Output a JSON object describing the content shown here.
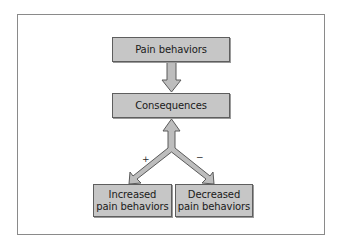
{
  "diagram": {
    "nodes": {
      "pain_behaviors": "Pain behaviors",
      "consequences": "Consequences",
      "increased": {
        "line1": "Increased",
        "line2": "pain behaviors"
      },
      "decreased": {
        "line1": "Decreased",
        "line2": "pain behaviors"
      }
    },
    "edges": [
      {
        "from": "Pain behaviors",
        "to": "Consequences",
        "label": ""
      },
      {
        "from": "Consequences",
        "to": "Increased pain behaviors",
        "label": "+"
      },
      {
        "from": "Consequences",
        "to": "Decreased pain behaviors",
        "label": "−"
      }
    ],
    "labels": {
      "plus": "+",
      "minus": "−"
    },
    "colors": {
      "node_fill": "#c6c6c6",
      "node_border": "#5e5e5e",
      "arrow_fill": "#bdbdbd",
      "arrow_stroke": "#5a5a5a",
      "frame_border": "#8a8a8a"
    }
  }
}
